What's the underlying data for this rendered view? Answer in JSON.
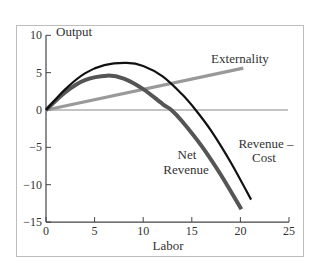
{
  "caption_partial": "the following ... ly",
  "chart_data": {
    "type": "line",
    "title": "",
    "xlabel": "Labor",
    "ylabel": "Output",
    "xlim": [
      0,
      25
    ],
    "ylim": [
      -15,
      10
    ],
    "x_ticks": [
      "0",
      "5",
      "10",
      "15",
      "20",
      "25"
    ],
    "y_ticks": [
      "10",
      "5",
      "0",
      "-5",
      "-10",
      "-15"
    ],
    "grid": false,
    "legend": "inline labels",
    "series": [
      {
        "name": "Revenue – Cost",
        "color": "#111111",
        "x": [
          0,
          2,
          4,
          6,
          8.3,
          10,
          12,
          14,
          15.4,
          17,
          19,
          21.1
        ],
        "values": [
          0,
          2.8,
          4.9,
          6.0,
          6.3,
          5.9,
          4.5,
          2.1,
          0,
          -2.8,
          -7.0,
          -12.0
        ]
      },
      {
        "name": "Net Revenue",
        "color": "#555555",
        "x": [
          0,
          2,
          4,
          6.3,
          8,
          10,
          12,
          12.9,
          14,
          16,
          18,
          20.1
        ],
        "values": [
          0,
          2.4,
          4.0,
          4.6,
          4.2,
          2.8,
          0.8,
          0,
          -1.5,
          -4.8,
          -8.7,
          -13.3
        ]
      },
      {
        "name": "Externality",
        "color": "#999999",
        "x": [
          0,
          20.3
        ],
        "values": [
          0,
          5.6
        ]
      },
      {
        "name": "zero line",
        "color": "#888888",
        "x": [
          0,
          24.9
        ],
        "values": [
          0,
          0
        ]
      }
    ],
    "annotations": [
      "Externality",
      "Net Revenue",
      "Revenue – Cost"
    ]
  },
  "labels": {
    "y_axis_title": "Output",
    "x_axis_title": "Labor",
    "externality": "Externality",
    "net_revenue_line1": "Net",
    "net_revenue_line2": "Revenue",
    "rev_cost_line1": "Revenue –",
    "rev_cost_line2": "Cost"
  }
}
